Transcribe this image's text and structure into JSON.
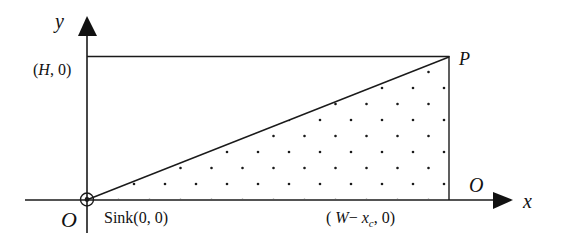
{
  "diagram": {
    "type": "geometric-coordinate-diagram",
    "axes": {
      "x_label": "x",
      "y_label": "y"
    },
    "labels": {
      "origin": "O",
      "origin_right": "O",
      "sink": "Sink(0, 0)",
      "top_left": "(H, 0)",
      "top_left_var": "H",
      "bottom_right_prefix": "( W− x",
      "bottom_right_sub": "c",
      "bottom_right_suffix": ", 0)",
      "corner": "P"
    },
    "regions": [
      {
        "name": "rectangle",
        "description": "Rectangle from origin to P bounded by axes, top line and right side"
      },
      {
        "name": "dotted-triangle",
        "description": "Triangle from Sink(0,0) to P to (W-x_c,0), filled with dot pattern"
      }
    ],
    "colors": {
      "line": "#1a1a1a",
      "background": "#ffffff"
    }
  }
}
